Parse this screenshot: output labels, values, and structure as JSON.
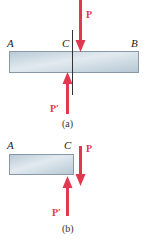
{
  "colors": {
    "force": "#e0384f",
    "bar_light": "#dfe8ee",
    "bar_dark": "#b3c5d2",
    "bar_border": "#8898a6",
    "cut_line": "#333333"
  },
  "figure_a": {
    "caption": "(a)",
    "point_labels": {
      "left": "A",
      "cut": "C",
      "right": "B"
    },
    "forces": {
      "top": "P",
      "bottom": "P′"
    }
  },
  "figure_b": {
    "caption": "(b)",
    "point_labels": {
      "left": "A",
      "cut": "C"
    },
    "forces": {
      "top": "P",
      "bottom": "P′"
    }
  }
}
